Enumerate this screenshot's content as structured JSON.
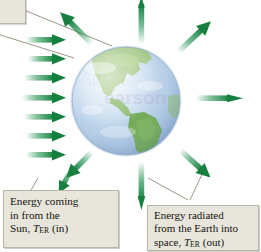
{
  "figure": {
    "name": "earth-energy-balance-diagram",
    "background_color": "#ffffff"
  },
  "globe": {
    "name": "earth-globe",
    "ocean_color": "#b9cfe8",
    "land_color": "#8fb86a",
    "highlight_color": "#e8f1fb",
    "edge_color": "#8ba6c4",
    "center_x": 126,
    "center_y": 101,
    "radius": 54,
    "watermark_text": "Pearson",
    "watermark_color": "#b9b2cf"
  },
  "arrows": {
    "incoming": {
      "name": "incoming-solar-arrow",
      "color": "#1a8f4a",
      "tail_color": "#cfe8da",
      "count": 7,
      "direction": "right",
      "label_ref": "caption_sun"
    },
    "outgoing": {
      "name": "outgoing-radiation-arrow",
      "color": "#1f8f4e",
      "tail_color": "#d7ecdf",
      "count": 8,
      "direction": "radial-outward",
      "label_ref": "caption_earth"
    }
  },
  "leader_lines": {
    "name": "leader-line",
    "color": "#9a9686",
    "count": 4
  },
  "caption_sun": {
    "name": "caption-sun",
    "line1": "Energy coming",
    "line2": "in from the",
    "line3_prefix": "Sun, ",
    "symbol": "T",
    "subscript": "ER",
    "line3_suffix": " (in)",
    "background": "#e8e6dc",
    "border": "#b9b5a5"
  },
  "caption_earth": {
    "name": "caption-earth",
    "line1": "Energy radiated",
    "line2": "from the Earth into",
    "line3_prefix": "space, ",
    "symbol": "T",
    "subscript": "ER",
    "line3_suffix": " (out)",
    "background": "#e8e6dc",
    "border": "#b9b5a5"
  }
}
